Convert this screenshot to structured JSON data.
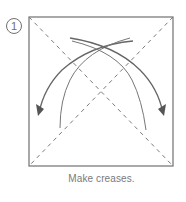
{
  "step": {
    "number": "1",
    "caption": "Make creases."
  },
  "diagram": {
    "type": "origami-instruction",
    "paper_shape": "square",
    "creases": [
      "diagonal-top-left-to-bottom-right",
      "diagonal-top-right-to-bottom-left"
    ],
    "crease_style": "dashed (valley fold)",
    "arrows": [
      {
        "name": "fold-arrow-left",
        "direction": "from top-right toward bottom-left"
      },
      {
        "name": "fold-arrow-right",
        "direction": "from top-left toward bottom-right"
      }
    ],
    "colors": {
      "line": "#6b6b6b",
      "frame": "#707070",
      "text": "#7a7a7a"
    }
  }
}
